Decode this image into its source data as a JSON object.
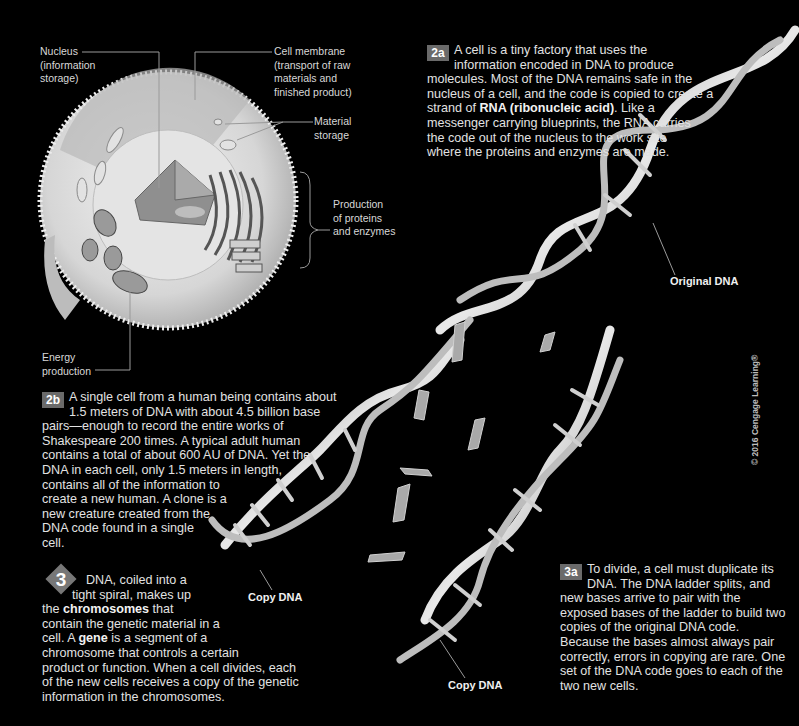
{
  "cell_diagram": {
    "labels": {
      "nucleus": [
        "Nucleus",
        "(information",
        "storage)"
      ],
      "cell_membrane": [
        "Cell membrane",
        "(transport of raw",
        "materials and",
        "finished product)"
      ],
      "material_storage": [
        "Material",
        "storage"
      ],
      "production": [
        "Production",
        "of proteins",
        "and enzymes"
      ],
      "energy": [
        "Energy",
        "production"
      ]
    }
  },
  "sections": {
    "s2a": {
      "badge": "2a",
      "lines": [
        "A cell is a tiny factory that uses the",
        "information encoded in DNA to produce",
        "molecules. Most of the DNA remains safe in the",
        "nucleus of a cell, and the code is copied to create a",
        "strand of ",
        "RNA (ribonucleic acid)",
        ". Like a",
        "messenger carrying blueprints, the RNA carries",
        "the code out of the nucleus to the work site",
        "where the proteins and enzymes are made."
      ]
    },
    "s2b": {
      "badge": "2b",
      "lines": [
        "A single cell from a human being contains about",
        "1.5 meters of DNA with about 4.5 billion base",
        "pairs—enough to record the entire works of",
        "Shakespeare 200 times. A typical adult human",
        "contains a total of about 600 AU of DNA. Yet the",
        "DNA in each cell, only 1.5 meters in length,",
        "contains all of the information to",
        "create a new human. A clone is a",
        "new creature created from the",
        "DNA code found in a single",
        "cell."
      ]
    },
    "s3": {
      "badge": "3",
      "lines": [
        "DNA, coiled into a",
        "tight spiral, makes up",
        "the ",
        "chromosomes",
        " that",
        "contain the genetic material in a",
        "cell. A ",
        "gene",
        " is a segment of a",
        "chromosome that controls a certain",
        "product or function. When a cell divides, each",
        "of the new cells receives a copy of the genetic",
        "information in the chromosomes."
      ]
    },
    "s3a": {
      "badge": "3a",
      "lines": [
        "To divide, a cell must duplicate its",
        "DNA. The DNA ladder splits, and",
        "new bases arrive to pair with the",
        "exposed bases of the ladder to build two",
        "copies of the original DNA code.",
        "Because the bases almost always pair",
        "correctly, errors in copying are rare. One",
        "set of the DNA code goes to each of the",
        "two new cells."
      ]
    }
  },
  "dna_labels": {
    "original": "Original DNA",
    "copy_left": "Copy DNA",
    "copy_right": "Copy DNA"
  },
  "copyright": "© 2016 Cengage Learning®",
  "colors": {
    "background": "#000000",
    "badge": "#6a6a6a",
    "text": "#e2e2e2"
  }
}
